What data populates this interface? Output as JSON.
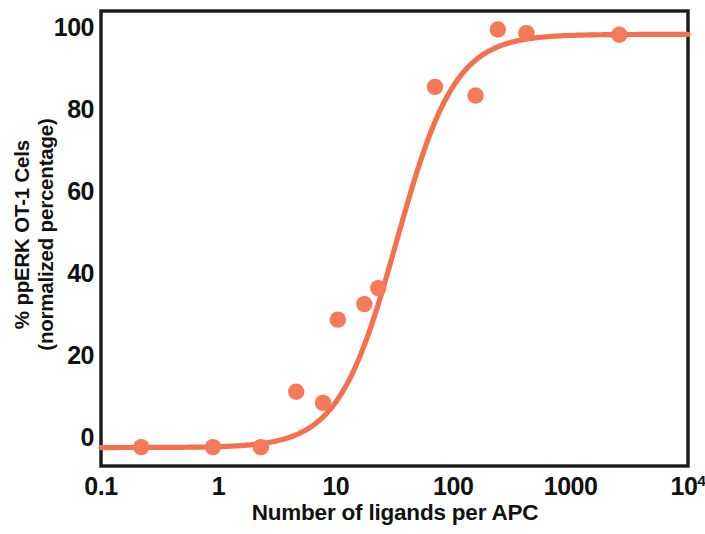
{
  "chart_data": {
    "type": "scatter",
    "title": "",
    "xlabel": "Number of ligands per APC",
    "ylabel_line1": "% ppERK OT-1 Cels",
    "ylabel_line2": "(normalized percentage)",
    "xscale": "log",
    "yscale": "linear",
    "xlim": [
      0.1,
      10000
    ],
    "ylim": [
      -7,
      104
    ],
    "grid": false,
    "legend": null,
    "marker_color": "#F47A59",
    "line_color": "#F4704E",
    "axis_color": "#1a1a1a",
    "xticklabels": [
      "0.1",
      "1",
      "10",
      "100",
      "1000",
      "10⁴"
    ],
    "xtickvalues": [
      0.1,
      1,
      10,
      100,
      1000,
      10000
    ],
    "yticklabels": [
      "0",
      "20",
      "40",
      "60",
      "80",
      "100"
    ],
    "ytickvalues": [
      0,
      20,
      40,
      60,
      80,
      100
    ],
    "series": [
      {
        "name": "ppERK response",
        "kind": "scatter",
        "points": [
          {
            "x": 0.22,
            "y": -2.4
          },
          {
            "x": 0.9,
            "y": -2.4
          },
          {
            "x": 2.3,
            "y": -2.4
          },
          {
            "x": 4.6,
            "y": 11.1
          },
          {
            "x": 7.8,
            "y": 8.4
          },
          {
            "x": 10.4,
            "y": 28.7
          },
          {
            "x": 17.5,
            "y": 32.5
          },
          {
            "x": 23.0,
            "y": 36.4
          },
          {
            "x": 70.0,
            "y": 85.5
          },
          {
            "x": 155.0,
            "y": 83.4
          },
          {
            "x": 240.0,
            "y": 99.5
          },
          {
            "x": 420.0,
            "y": 98.6
          },
          {
            "x": 2600.0,
            "y": 98.2
          }
        ]
      },
      {
        "name": "sigmoid fit",
        "kind": "line",
        "model": "four-parameter logistic",
        "bottom": -2.5,
        "top": 98.3,
        "ec50": 33.0,
        "hillslope": 1.75
      }
    ]
  }
}
